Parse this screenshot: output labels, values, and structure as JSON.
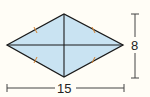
{
  "diagram": {
    "shape": "rhombus",
    "fill_color": "#c9e3f2",
    "stroke_color": "#1a1a1a",
    "tick_color": "#d9822b",
    "vertices": {
      "left": [
        7,
        45
      ],
      "top": [
        64,
        14
      ],
      "right": [
        123,
        45
      ],
      "bottom": [
        64,
        77
      ]
    },
    "diagonals": {
      "horizontal": 15,
      "vertical": 8
    },
    "labels": {
      "horizontal_dimension": "15",
      "vertical_dimension": "8"
    },
    "congruent_side_ticks": 4
  }
}
